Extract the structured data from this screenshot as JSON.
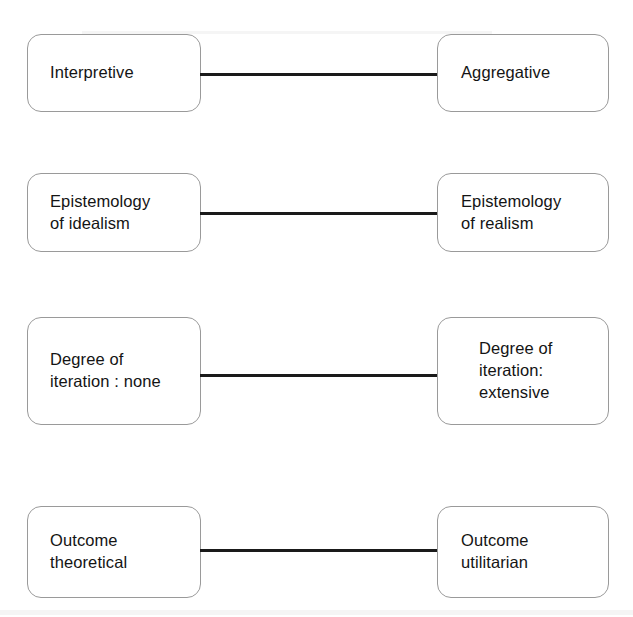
{
  "diagram": {
    "type": "paired-continuum-diagram",
    "orientation": "horizontal",
    "background_color": "#ffffff",
    "box_border_color": "#9a9a9a",
    "connector_color": "#1a1a1a",
    "text_color": "#141414",
    "rows": [
      {
        "id": "row-1",
        "left": {
          "text": "Interpretive",
          "lines": [
            "Interpretive"
          ]
        },
        "right": {
          "text": "Aggregative",
          "lines": [
            "Aggregative"
          ]
        }
      },
      {
        "id": "row-2",
        "left": {
          "text": "Epistemology\nof idealism",
          "lines": [
            "Epistemology",
            "of idealism"
          ]
        },
        "right": {
          "text": "Epistemology\nof realism",
          "lines": [
            "Epistemology",
            "of realism"
          ]
        }
      },
      {
        "id": "row-3",
        "left": {
          "text": "Degree of\niteration : none",
          "lines": [
            "Degree of",
            "iteration : none"
          ]
        },
        "right": {
          "text": "Degree of\niteration:\nextensive",
          "lines": [
            "Degree of",
            "iteration:",
            "extensive"
          ]
        }
      },
      {
        "id": "row-4",
        "left": {
          "text": "Outcome\ntheoretical",
          "lines": [
            "Outcome",
            "theoretical"
          ]
        },
        "right": {
          "text": "Outcome\nutilitarian",
          "lines": [
            "Outcome",
            "utilitarian"
          ]
        }
      }
    ]
  }
}
